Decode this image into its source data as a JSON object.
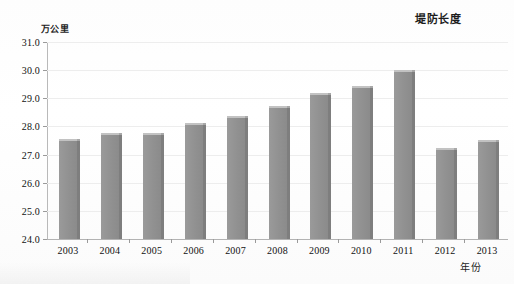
{
  "chart_data": {
    "type": "bar",
    "title": "堤防长度",
    "xlabel": "年份",
    "ylabel": "万公里",
    "categories": [
      "2003",
      "2004",
      "2005",
      "2006",
      "2007",
      "2008",
      "2009",
      "2010",
      "2011",
      "2012",
      "2013"
    ],
    "values": [
      27.5,
      27.7,
      27.7,
      28.05,
      28.3,
      28.65,
      29.1,
      29.35,
      29.95,
      27.15,
      27.45
    ],
    "ylim": [
      24.0,
      31.0
    ],
    "ytick_step": 1.0,
    "ytick_labels": [
      "31.0",
      "30.0",
      "29.0",
      "28.0",
      "27.0",
      "26.0",
      "25.0",
      "24.0"
    ],
    "ytick_values": [
      31.0,
      30.0,
      29.0,
      28.0,
      27.0,
      26.0,
      25.0,
      24.0
    ],
    "grid": true,
    "legend": false,
    "legend_position": "none",
    "series": [
      {
        "name": "堤防长度",
        "values": [
          27.5,
          27.7,
          27.7,
          28.05,
          28.3,
          28.65,
          29.1,
          29.35,
          29.95,
          27.15,
          27.45
        ]
      }
    ],
    "colors": {
      "bar_face": "#919191",
      "bar_side": "#7e7e7e",
      "bar_top": "#c2c2c2",
      "axis": "#b3b3b3",
      "grid": "#ededed",
      "text": "#111111",
      "background": "#ffffff"
    }
  }
}
